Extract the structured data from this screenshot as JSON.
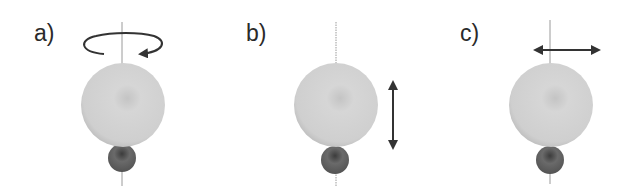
{
  "figure": {
    "panels": [
      {
        "id": "a",
        "label": "a)",
        "motion": "rotation",
        "label_x": 34,
        "label_y": 41,
        "axis_x": 122,
        "big_sphere": {
          "cx": 123,
          "cy": 105,
          "r": 42
        },
        "small_sphere": {
          "cx": 122,
          "cy": 158,
          "r": 14
        }
      },
      {
        "id": "b",
        "label": "b)",
        "motion": "vertical-translation",
        "label_x": 246,
        "label_y": 41,
        "axis_x": 336,
        "big_sphere": {
          "cx": 336,
          "cy": 105,
          "r": 42
        },
        "small_sphere": {
          "cx": 335,
          "cy": 160,
          "r": 14
        }
      },
      {
        "id": "c",
        "label": "c)",
        "motion": "horizontal-translation",
        "label_x": 460,
        "label_y": 41,
        "axis_x": 550,
        "big_sphere": {
          "cx": 551,
          "cy": 105,
          "r": 42
        },
        "small_sphere": {
          "cx": 550,
          "cy": 160,
          "r": 14
        }
      }
    ],
    "colors": {
      "big_sphere_light": "#d8d8d8",
      "big_sphere_dark": "#a9a9a9",
      "small_sphere_light": "#9a9a9a",
      "small_sphere_dark": "#4a4a4a",
      "axis": "#9a9a9a",
      "arrow": "#333333",
      "text": "#2a2a2a"
    }
  }
}
